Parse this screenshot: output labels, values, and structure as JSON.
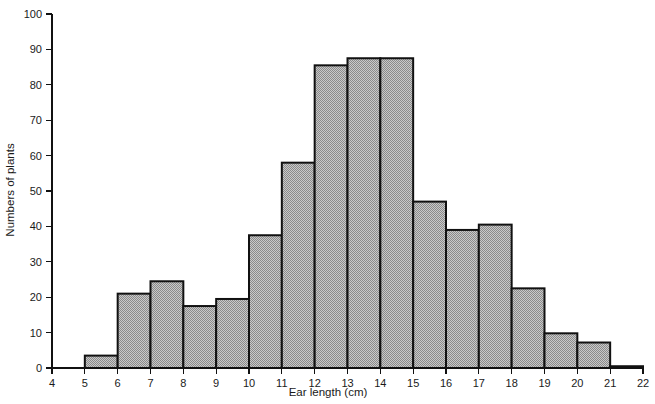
{
  "chart_data": {
    "type": "bar",
    "title": "",
    "subtitle": "",
    "xlabel": "Ear length (cm)",
    "ylabel": "Numbers of plants",
    "grid": false,
    "legend": false,
    "legend_position": "none",
    "xlim": [
      4,
      22
    ],
    "ylim": [
      0,
      100
    ],
    "xticks": [
      4,
      5,
      6,
      7,
      8,
      9,
      10,
      11,
      12,
      13,
      14,
      15,
      16,
      17,
      18,
      19,
      20,
      21,
      22
    ],
    "yticks": [
      0,
      10,
      20,
      30,
      40,
      50,
      60,
      70,
      80,
      90,
      100
    ],
    "xtick_labels": [
      "4",
      "5",
      "6",
      "7",
      "8",
      "9",
      "10",
      "11",
      "12",
      "13",
      "14",
      "15",
      "16",
      "17",
      "18",
      "19",
      "20",
      "21",
      "22"
    ],
    "ytick_labels": [
      "0",
      "10",
      "20",
      "30",
      "40",
      "50",
      "60",
      "70",
      "80",
      "90",
      "100"
    ],
    "bin_width": 1,
    "bin_edges": [
      5,
      6,
      7,
      8,
      9,
      10,
      11,
      12,
      13,
      14,
      15,
      16,
      17,
      18,
      19,
      20,
      21,
      22
    ],
    "categories": [
      "5-6",
      "6-7",
      "7-8",
      "8-9",
      "9-10",
      "10-11",
      "11-12",
      "12-13",
      "13-14",
      "14-15",
      "15-16",
      "16-17",
      "17-18",
      "18-19",
      "19-20",
      "20-21",
      "21-22"
    ],
    "values": [
      3.5,
      21,
      24.5,
      17.5,
      19.5,
      37.5,
      58,
      85.5,
      87.5,
      87.5,
      47,
      39,
      40.5,
      22.5,
      9.8,
      7.2,
      0.5
    ],
    "bar_fill": "#a8a8a8",
    "bar_edge": "#111111",
    "background": "#ffffff",
    "annotations": []
  }
}
